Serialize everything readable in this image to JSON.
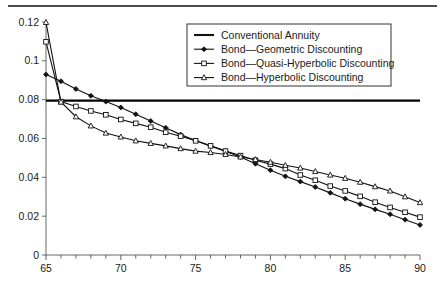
{
  "chart_data": {
    "type": "line",
    "title": "",
    "subtitle": "",
    "xlabel": "",
    "ylabel": "",
    "xlim": [
      65,
      90
    ],
    "ylim": [
      0,
      0.12
    ],
    "grid": false,
    "legend_position": "top-center",
    "x_ticks": [
      65,
      70,
      75,
      80,
      85,
      90
    ],
    "x_tick_labels": [
      "65",
      "70",
      "75",
      "80",
      "85",
      "90"
    ],
    "x_minor_step": 1,
    "y_ticks": [
      0,
      0.02,
      0.04,
      0.06,
      0.08,
      0.1,
      0.12
    ],
    "y_tick_labels": [
      "0",
      "0.02",
      "0.04",
      "0.06",
      "0.08",
      "0.1",
      "0.12"
    ],
    "x": [
      65,
      66,
      67,
      68,
      69,
      70,
      71,
      72,
      73,
      74,
      75,
      76,
      77,
      78,
      79,
      80,
      81,
      82,
      83,
      84,
      85,
      86,
      87,
      88,
      89,
      90
    ],
    "series": [
      {
        "name": "Conventional Annuity",
        "marker": "none",
        "style": "flat-horizontal",
        "constant_value": 0.0795,
        "values": [
          0.0795,
          0.0795,
          0.0795,
          0.0795,
          0.0795,
          0.0795,
          0.0795,
          0.0795,
          0.0795,
          0.0795,
          0.0795,
          0.0795,
          0.0795,
          0.0795,
          0.0795,
          0.0795,
          0.0795,
          0.0795,
          0.0795,
          0.0795,
          0.0795,
          0.0795,
          0.0795,
          0.0795,
          0.0795,
          0.0795
        ]
      },
      {
        "name": "Bond—Geometric Discounting",
        "marker": "filled-diamond",
        "values": [
          0.093,
          0.0895,
          0.0855,
          0.082,
          0.079,
          0.076,
          0.0725,
          0.069,
          0.0655,
          0.062,
          0.059,
          0.0562,
          0.0535,
          0.0505,
          0.047,
          0.0437,
          0.0405,
          0.0378,
          0.035,
          0.032,
          0.029,
          0.0262,
          0.0235,
          0.021,
          0.0182,
          0.0155
        ]
      },
      {
        "name": "Bond—Quasi-Hyperbolic Discounting",
        "marker": "open-square",
        "values": [
          0.1098,
          0.079,
          0.0765,
          0.0742,
          0.0722,
          0.0698,
          0.0678,
          0.0658,
          0.0632,
          0.0612,
          0.0588,
          0.0562,
          0.0535,
          0.0512,
          0.0488,
          0.0468,
          0.0445,
          0.0412,
          0.0385,
          0.0355,
          0.033,
          0.0302,
          0.0272,
          0.0245,
          0.022,
          0.0195
        ]
      },
      {
        "name": "Bond—Hyperbolic Discounting",
        "marker": "open-triangle",
        "values": [
          0.1198,
          0.0788,
          0.0712,
          0.0665,
          0.0628,
          0.0608,
          0.0588,
          0.0575,
          0.0562,
          0.0548,
          0.0535,
          0.0528,
          0.0518,
          0.0505,
          0.0492,
          0.0478,
          0.0462,
          0.0448,
          0.043,
          0.0412,
          0.0395,
          0.0375,
          0.0352,
          0.033,
          0.03,
          0.027
        ]
      }
    ]
  },
  "legend": {
    "entries": [
      {
        "label": "Conventional Annuity",
        "marker": "none"
      },
      {
        "label": "Bond—Geometric Discounting",
        "marker": "filled-diamond"
      },
      {
        "label": "Bond—Quasi-Hyperbolic Discounting",
        "marker": "open-square"
      },
      {
        "label": "Bond—Hyperbolic Discounting",
        "marker": "open-triangle"
      }
    ]
  },
  "colors": {
    "line": "#111111",
    "axis": "#666666",
    "text": "#1a1a1a",
    "background": "#ffffff",
    "rule": "#4d4d4d"
  }
}
